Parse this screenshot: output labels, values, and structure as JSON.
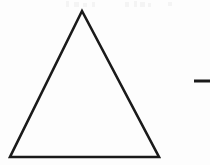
{
  "canvas": {
    "width": 210,
    "height": 165,
    "background_color": "#fdfdfd",
    "description": "Scanned black-and-white line drawing of a large unfilled triangle with a short horizontal dash to its right"
  },
  "figure": {
    "name": "triangle-line-drawing",
    "stroke_color": "#1a1a1a",
    "fill_color": "none",
    "stroke_width": 2.6,
    "vertices": {
      "apex": {
        "x": 82,
        "y": 11
      },
      "bottom_left": {
        "x": 10,
        "y": 157
      },
      "bottom_right": {
        "x": 159,
        "y": 157
      }
    },
    "points_path": "82,11 159,157 10,157",
    "label": "Triangle"
  },
  "dash_mark": {
    "name": "horizontal-dash",
    "x1": 194,
    "y1": 81,
    "x2": 210,
    "y2": 81,
    "stroke_color": "#1a1a1a",
    "stroke_width": 3,
    "label": "Dash"
  },
  "scan_artifacts": {
    "label": "Faint scanner speckle along top edge",
    "color": "#f4f4f4",
    "marks": [
      {
        "x": 66,
        "y": 1,
        "w": 3,
        "h": 6
      },
      {
        "x": 74,
        "y": 2,
        "w": 5,
        "h": 5
      },
      {
        "x": 83,
        "y": 3,
        "w": 4,
        "h": 4
      },
      {
        "x": 92,
        "y": 2,
        "w": 3,
        "h": 5
      },
      {
        "x": 125,
        "y": 2,
        "w": 4,
        "h": 5
      },
      {
        "x": 134,
        "y": 1,
        "w": 3,
        "h": 6
      },
      {
        "x": 140,
        "y": 2,
        "w": 5,
        "h": 5
      },
      {
        "x": 148,
        "y": 3,
        "w": 3,
        "h": 4
      },
      {
        "x": 168,
        "y": 2,
        "w": 4,
        "h": 4
      }
    ]
  }
}
